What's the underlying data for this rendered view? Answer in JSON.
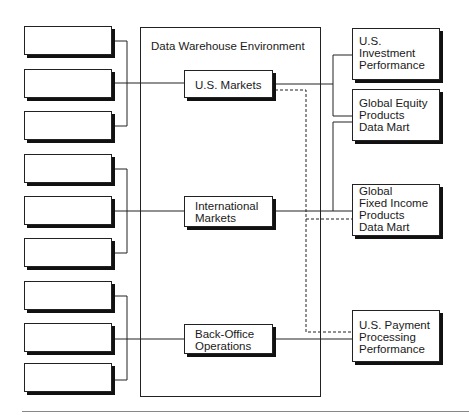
{
  "environment": {
    "title": "Data Warehouse Environment"
  },
  "sources": {
    "count": 9,
    "items": [
      "",
      "",
      "",
      "",
      "",
      "",
      "",
      "",
      ""
    ]
  },
  "warehouse_nodes": [
    {
      "label": "U.S. Markets"
    },
    {
      "label": "International\nMarkets"
    },
    {
      "label": "Back-Office\nOperations"
    }
  ],
  "data_marts": [
    {
      "label": "U.S.\nInvestment\nPerformance"
    },
    {
      "label": "Global Equity\nProducts\nData Mart"
    },
    {
      "label": "Global\nFixed Income\nProducts\nData Mart"
    },
    {
      "label": "U.S. Payment\nProcessing\nPerformance"
    }
  ],
  "colors": {
    "line": "#222222",
    "shadow": "#111111",
    "rule": "#888888"
  }
}
